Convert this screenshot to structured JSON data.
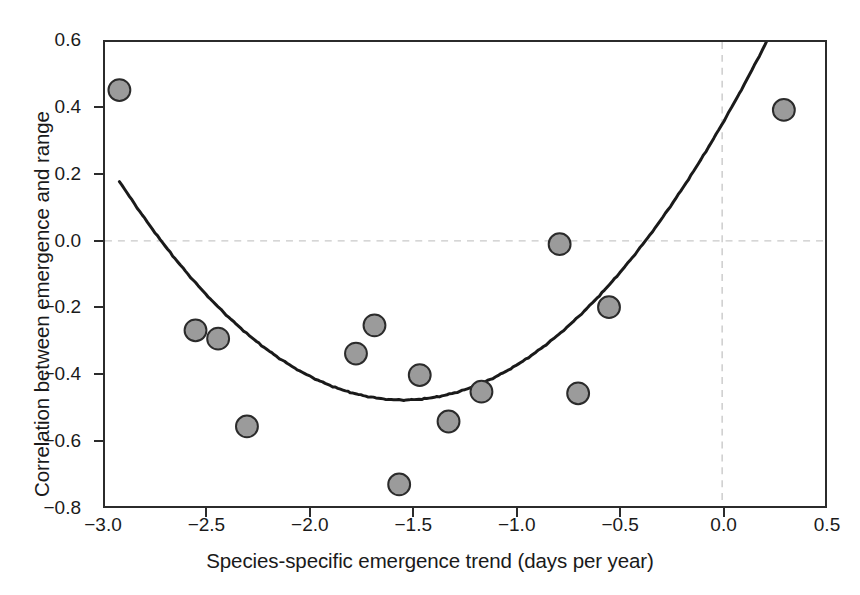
{
  "chart_data": {
    "type": "scatter",
    "title": "",
    "xlabel": "Species-specific emergence trend (days per year)",
    "ylabel": "Correlation between emergence and range",
    "xlim": [
      -3.0,
      0.5
    ],
    "ylim": [
      -0.8,
      0.6
    ],
    "xticks": [
      "-3.0",
      "-2.5",
      "-2.0",
      "-1.5",
      "-1.0",
      "-0.5",
      "0.0",
      "0.5"
    ],
    "xtick_values": [
      -3.0,
      -2.5,
      -2.0,
      -1.5,
      -1.0,
      -0.5,
      0.0,
      0.5
    ],
    "yticks": [
      "0.6",
      "0.4",
      "0.2",
      "0.0",
      "-0.2",
      "-0.4",
      "-0.6",
      "-0.8"
    ],
    "ytick_values": [
      0.6,
      0.4,
      0.2,
      0.0,
      -0.2,
      -0.4,
      -0.6,
      -0.8
    ],
    "grid": "reference-lines-at-zero",
    "gridlines": [
      {
        "axis": "y",
        "value": 0.0,
        "style": "dashed",
        "color": "#c9c9c9"
      },
      {
        "axis": "x",
        "value": 0.0,
        "style": "dashed",
        "color": "#c9c9c9"
      }
    ],
    "legend": null,
    "marker": {
      "shape": "circle",
      "fill_color": "#9b9b9b",
      "edge_color": "#2b2b2b",
      "diameter_px": 24
    },
    "points": [
      {
        "x": -2.93,
        "y": 0.455
      },
      {
        "x": -2.56,
        "y": -0.27
      },
      {
        "x": -2.45,
        "y": -0.295
      },
      {
        "x": -2.31,
        "y": -0.56
      },
      {
        "x": -1.78,
        "y": -0.34
      },
      {
        "x": -1.69,
        "y": -0.255
      },
      {
        "x": -1.57,
        "y": -0.735
      },
      {
        "x": -1.47,
        "y": -0.405
      },
      {
        "x": -1.33,
        "y": -0.545
      },
      {
        "x": -1.17,
        "y": -0.455
      },
      {
        "x": -0.79,
        "y": -0.01
      },
      {
        "x": -0.7,
        "y": -0.46
      },
      {
        "x": -0.55,
        "y": -0.2
      },
      {
        "x": 0.3,
        "y": 0.395
      }
    ],
    "fit_curve": {
      "name": "quadratic-fit",
      "color": "#1a1a1a",
      "width_px": 3,
      "vertex": {
        "x": -1.55,
        "y": -0.48
      },
      "x_start": -2.93,
      "x_end": 0.28,
      "y_start": 0.18,
      "y_end": 0.47,
      "coefficients": {
        "a": 0.3,
        "b": 0.93,
        "c": 0.245
      }
    }
  }
}
